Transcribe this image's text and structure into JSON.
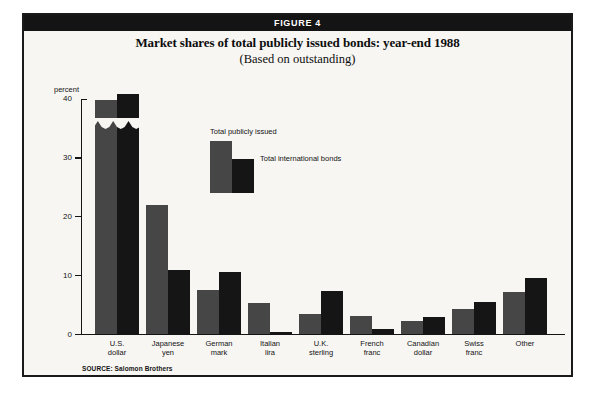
{
  "figure": {
    "banner_label": "FIGURE 4",
    "title": "Market shares of total publicly issued bonds: year-end 1988",
    "subtitle": "(Based on outstanding)",
    "source": "SOURCE: Salomon Brothers"
  },
  "colors": {
    "banner_background": "#141414",
    "page_background": "#f7f6f3",
    "frame_border": "#1a1a1a",
    "series_primary": "#464646",
    "series_secondary": "#151515",
    "text": "#141414"
  },
  "legend": {
    "position": "inside-top-center",
    "entries": [
      {
        "label": "Total publicly issued",
        "color": "#464646"
      },
      {
        "label": "Total international bonds",
        "color": "#151515"
      }
    ]
  },
  "chart_data": {
    "type": "bar",
    "title": "Market shares of total publicly issued bonds: year-end 1988",
    "subtitle": "(Based on outstanding)",
    "xlabel": "",
    "ylabel": "percent",
    "ylim": [
      0,
      40
    ],
    "yticks": [
      0,
      10,
      20,
      30,
      40
    ],
    "ytick_labels": [
      "0",
      "10",
      "20",
      "30",
      "40"
    ],
    "grid": false,
    "axis_break_note": "U.S. dollar bars are truncated with a zig-zag break; their true values are printed above the bars.",
    "categories": [
      "U.S. dollar",
      "Japanese yen",
      "German mark",
      "Italian lira",
      "U.K. sterling",
      "French franc",
      "Canadian dollar",
      "Swiss franc",
      "Other"
    ],
    "category_lines": [
      [
        "U.S.",
        "dollar"
      ],
      [
        "Japanese",
        "yen"
      ],
      [
        "German",
        "mark"
      ],
      [
        "Italian",
        "lira"
      ],
      [
        "U.K.",
        "sterling"
      ],
      [
        "French",
        "franc"
      ],
      [
        "Canadian",
        "dollar"
      ],
      [
        "Swiss",
        "franc"
      ],
      [
        "Other",
        ""
      ]
    ],
    "series": [
      {
        "name": "Total publicly issued",
        "color": "#464646",
        "values": [
          46.3,
          22.0,
          7.6,
          5.4,
          3.4,
          3.2,
          2.3,
          4.4,
          7.3
        ],
        "plotted_values": [
          36.5,
          22.0,
          7.6,
          5.4,
          3.4,
          3.2,
          2.3,
          4.4,
          7.3
        ],
        "data_labels": [
          "46.3",
          "",
          "",
          "",
          "",
          "",
          "",
          "",
          ""
        ]
      },
      {
        "name": "Total international bonds",
        "color": "#151515",
        "values": [
          48.0,
          11.0,
          10.6,
          0.4,
          7.4,
          1.0,
          3.0,
          5.6,
          9.6
        ],
        "plotted_values": [
          37.5,
          11.0,
          10.6,
          0.4,
          7.4,
          1.0,
          3.0,
          5.6,
          9.6
        ],
        "data_labels": [
          "48.0",
          "",
          "",
          "",
          "",
          "",
          "",
          "",
          ""
        ]
      }
    ]
  },
  "geometry": {
    "baseline_y": 319.5,
    "axis_top_y": 84,
    "px_per_unit": 5.885,
    "group_left_x": [
      71,
      122,
      173,
      224,
      275,
      326,
      377,
      428,
      479
    ],
    "bar_width": 22,
    "group_pitch": 51
  }
}
